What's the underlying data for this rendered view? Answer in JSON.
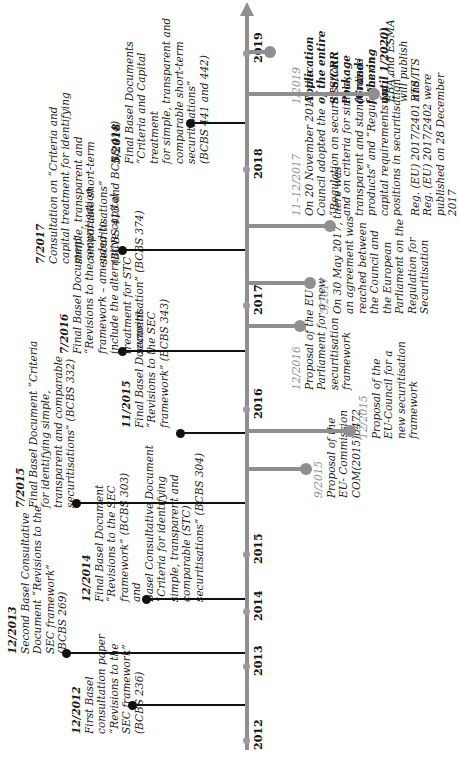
{
  "timeline": {
    "years": [
      "2012",
      "2013",
      "2014",
      "2015",
      "2016",
      "2017",
      "2018",
      "2019"
    ],
    "colors": {
      "axis": "#8f8f8f",
      "basel": "#111111",
      "eu_date": "#8f8f8f"
    }
  },
  "basel_events": [
    {
      "date": "12/2012",
      "text": "First Basel\nconsultation paper\n“Revisions to the\nSEC framework”\n(BCBS 236)"
    },
    {
      "date": "12/2013",
      "text": "Second Basel Consultative\nDocument “Revisions to the\nSEC framework”\n(BCBS 269)"
    },
    {
      "date": "12/2014",
      "text": "Final Basel Document\n“Revisions to the SEC\nframework” (BCBS 303)\nand\nBasel Consultative Document\n“Criteria for identifying\nsimple, transparent and\ncomparable (STC)\nsecuritisations” (BCBS 304)"
    },
    {
      "date": "7/2015",
      "text": "Final Basel Document “Criteria\nfor identifying simple,\ntransparent and comparable\nsecuritisations” (BCBS 332)"
    },
    {
      "date": "11/2015",
      "text": "Final Basel Document\n“Revisions to the SEC\nframework” (BCBS 343)"
    },
    {
      "date": "7/2016",
      "text": "Final Basel Document\n“Revisions to the securitisation\nframework – amended to\ninclude the alternative capital\ntreatment for STC\nsecuritisation” (BCBS 374)"
    },
    {
      "date": "7/2017",
      "text": "Consultation on “Criteria and\ncapital treatment for identifying\nsimple, transparent and\ncomparable short-term\nsecuritisations”\n(BCBS 413 and BCBS 414)"
    },
    {
      "date": "5/2018",
      "text": "Final Basel Documents\n“Criteria and Capital treatment\nfor simple, transparent and\ncomparable short-term securitisations”\n(BCBS 441 and 442)"
    }
  ],
  "eu_events": [
    {
      "date": "9/2015",
      "text": "Proposal of the\nEU- Commission\nCOM(2015)0472"
    },
    {
      "date": "12/2015",
      "text": "Proposal of the\nEU-Council for a\nnew securitisation\nframework"
    },
    {
      "date": "12/2016",
      "text": "Proposal of the EU-\nParliament for a new\nsecuritisation\nframework"
    },
    {
      "date": "5/2017",
      "text": "On 30 May 2017, there was\nan agreement was\nreached between\nthe Council and\nthe European\nParliament on the\nRegulation for\nSecuritisation"
    },
    {
      "date": "11–12/2017",
      "text": "On 20 November 2017, the\nCouncil adopted the\n“Regulation on securitisation\nand on criteria for simple,\ntransparent and standardised\nproducts” and “Regulation on\ncapital requirements for\npositions in securitisation”",
      "note": "Reg. (EU) 2017/2401 and\nReg. (EU) 2017/2402 were\npublished on 28 December\n2017"
    },
    {
      "date": "1/2019",
      "bold_text": "Application\nof the entire\nSTS/CRR\nPackage\n(Grand-\nfathering\nuntil 1/2020)",
      "note": "EBA and ESMA\nwill publish\nRTS/ITS"
    }
  ]
}
